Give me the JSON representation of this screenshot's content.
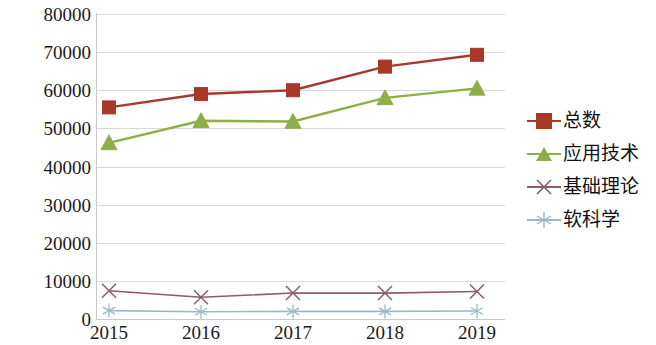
{
  "chart_data": {
    "type": "line",
    "title": "",
    "subtitle": "",
    "xlabel": "",
    "ylabel": "",
    "categories": [
      "2015",
      "2016",
      "2017",
      "2018",
      "2019"
    ],
    "x_tick_labels": [
      "2015",
      "2016",
      "2017",
      "2018",
      "2019"
    ],
    "y_tick_labels": [
      "80000",
      "70000",
      "60000",
      "50000",
      "40000",
      "30000",
      "20000",
      "10000",
      "0"
    ],
    "y_ticks": [
      80000,
      70000,
      60000,
      50000,
      40000,
      30000,
      20000,
      10000,
      0
    ],
    "ylim": [
      0,
      80000
    ],
    "grid": true,
    "legend_position": "right",
    "series": [
      {
        "name": "总数",
        "color": "#a8392a",
        "marker": "square",
        "values": [
          55500,
          59000,
          60000,
          66200,
          69300
        ]
      },
      {
        "name": "应用技术",
        "color": "#8faf46",
        "marker": "triangle",
        "values": [
          46200,
          52000,
          51800,
          58000,
          60500
        ]
      },
      {
        "name": "基础理论",
        "color": "#8e5a6e",
        "marker": "x",
        "values": [
          7400,
          5700,
          6800,
          6800,
          7200
        ]
      },
      {
        "name": "软科学",
        "color": "#9bb9c4",
        "marker": "asterisk",
        "values": [
          2200,
          1900,
          2000,
          2000,
          2100
        ]
      }
    ]
  },
  "legend": {
    "items": [
      {
        "label": "总数"
      },
      {
        "label": "应用技术"
      },
      {
        "label": "基础理论"
      },
      {
        "label": "软科学"
      }
    ]
  },
  "colors": {
    "total": "#a8392a",
    "applied_technology": "#8faf46",
    "basic_theory": "#8e5a6e",
    "soft_science": "#9bb9c4",
    "grid": "#d9d9d9",
    "text": "#1a1a1a",
    "background": "#ffffff"
  }
}
